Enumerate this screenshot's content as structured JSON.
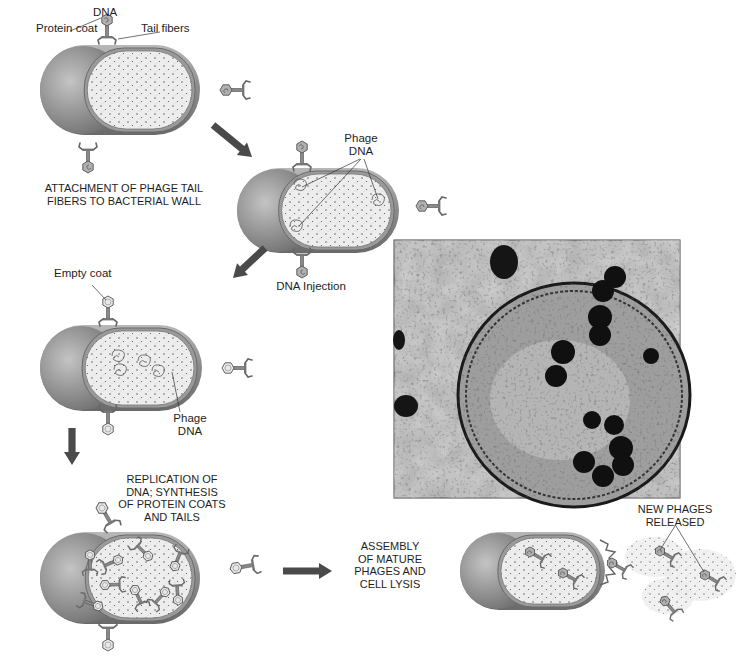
{
  "colors": {
    "cell_wall": "#8c8c8c",
    "cell_wall_dark": "#6e6e6e",
    "cytoplasm": "#ececec",
    "phage": "#8a8a8a",
    "arrow": "#4a4a4a",
    "micrograph_bg": "#b4b4b4",
    "micrograph_dark": "#101010"
  },
  "stages": [
    {
      "id": "attachment",
      "caption": [
        "ATTACHMENT OF PHAGE TAIL",
        "FIBERS TO BACTERIAL WALL"
      ],
      "labels": {
        "dna": "DNA",
        "protein_coat": "Protein coat",
        "tail_fibers": "Tail fibers"
      }
    },
    {
      "id": "injection",
      "caption": [
        "DNA Injection"
      ],
      "labels": {
        "phage_dna": [
          "Phage",
          "DNA"
        ]
      }
    },
    {
      "id": "empty-coats",
      "caption": [],
      "labels": {
        "empty_coat": "Empty coat",
        "phage_dna": [
          "Phage",
          "DNA"
        ]
      }
    },
    {
      "id": "replication",
      "caption": [
        "REPLICATION OF",
        "DNA; SYNTHESIS",
        "OF PROTEIN COATS",
        "AND TAILS"
      ],
      "labels": {}
    },
    {
      "id": "assembly-lysis",
      "caption": [
        "ASSEMBLY",
        "OF MATURE",
        "PHAGES AND",
        "CELL LYSIS"
      ],
      "labels": {
        "new_phages": [
          "NEW PHAGES",
          "RELEASED"
        ]
      }
    }
  ],
  "micrograph": {
    "description": "Electron micrograph of bacterial cell with phages"
  }
}
